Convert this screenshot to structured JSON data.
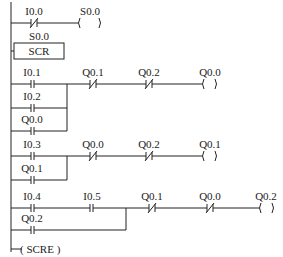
{
  "diagram": {
    "type": "ladder-logic",
    "networks": [
      {
        "name": "network-1",
        "elements": [
          {
            "kind": "nc-contact",
            "label": "I0.0"
          },
          {
            "kind": "coil",
            "label": "S0.0"
          }
        ]
      },
      {
        "name": "network-2",
        "elements": [
          {
            "kind": "box",
            "label_top": "S0.0",
            "label": "SCR"
          }
        ]
      },
      {
        "name": "network-3",
        "parallel": [
          {
            "kind": "no-contact",
            "label": "I0.1"
          },
          {
            "kind": "no-contact",
            "label": "I0.2"
          },
          {
            "kind": "no-contact",
            "label": "Q0.0"
          }
        ],
        "series": [
          {
            "kind": "nc-contact",
            "label": "Q0.1"
          },
          {
            "kind": "nc-contact",
            "label": "Q0.2"
          },
          {
            "kind": "coil",
            "label": "Q0.0"
          }
        ]
      },
      {
        "name": "network-4",
        "parallel": [
          {
            "kind": "no-contact",
            "label": "I0.3"
          },
          {
            "kind": "no-contact",
            "label": "Q0.1"
          }
        ],
        "series": [
          {
            "kind": "nc-contact",
            "label": "Q0.0"
          },
          {
            "kind": "nc-contact",
            "label": "Q0.2"
          },
          {
            "kind": "coil",
            "label": "Q0.1"
          }
        ]
      },
      {
        "name": "network-5",
        "parallel": [
          {
            "kind": "no-contact-series",
            "labels": [
              "I0.4",
              "I0.5"
            ]
          },
          {
            "kind": "no-contact",
            "label": "Q0.2"
          }
        ],
        "series": [
          {
            "kind": "nc-contact",
            "label": "Q0.1"
          },
          {
            "kind": "nc-contact",
            "label": "Q0.0"
          },
          {
            "kind": "coil",
            "label": "Q0.2"
          }
        ]
      },
      {
        "name": "network-6",
        "elements": [
          {
            "kind": "coil",
            "label": "SCRE"
          }
        ]
      }
    ]
  },
  "labels": {
    "n1_c1": "I0.0",
    "n1_coil": "S0.0",
    "n2_top": "S0.0",
    "n2_box": "SCR",
    "n3_p1": "I0.1",
    "n3_p2": "I0.2",
    "n3_p3": "Q0.0",
    "n3_s1": "Q0.1",
    "n3_s2": "Q0.2",
    "n3_coil": "Q0.0",
    "n4_p1": "I0.3",
    "n4_p2": "Q0.1",
    "n4_s1": "Q0.0",
    "n4_s2": "Q0.2",
    "n4_coil": "Q0.1",
    "n5_p1a": "I0.4",
    "n5_p1b": "I0.5",
    "n5_p2": "Q0.2",
    "n5_s1": "Q0.1",
    "n5_s2": "Q0.0",
    "n5_coil": "Q0.2",
    "n6_coil": "( SCRE )"
  }
}
